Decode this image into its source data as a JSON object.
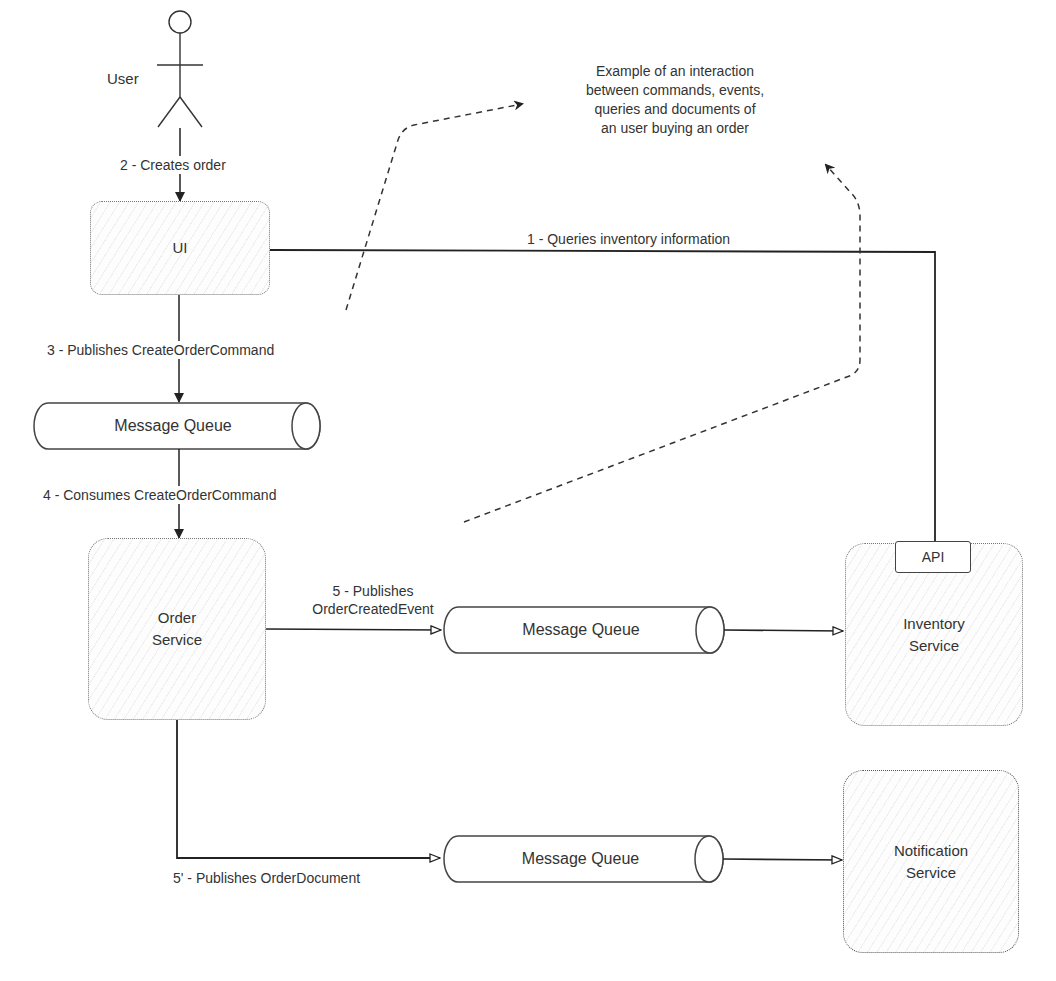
{
  "diagram": {
    "note": {
      "lines": [
        "Example of an interaction",
        "between commands, events,",
        "queries and documents of",
        "an user buying an order"
      ]
    },
    "actor": {
      "label": "User"
    },
    "nodes": {
      "ui": {
        "label": "UI"
      },
      "queue_1": {
        "label": "Message Queue"
      },
      "order_service": {
        "line1": "Order",
        "line2": "Service"
      },
      "queue_2": {
        "label": "Message Queue"
      },
      "queue_3": {
        "label": "Message Queue"
      },
      "inventory_service": {
        "line1": "Inventory",
        "line2": "Service",
        "api_label": "API"
      },
      "notification_service": {
        "line1": "Notification",
        "line2": "Service"
      }
    },
    "edges": {
      "step1": "1 - Queries inventory information",
      "step2": "2 - Creates order",
      "step3": "3 - Publishes CreateOrderCommand",
      "step4": "4 - Consumes CreateOrderCommand",
      "step5_line1": "5 - Publishes",
      "step5_line2": "OrderCreatedEvent",
      "step5b": "5' - Publishes OrderDocument"
    },
    "colors": {
      "stroke": "#333333",
      "box_border": "#777777",
      "background": "#ffffff"
    }
  }
}
